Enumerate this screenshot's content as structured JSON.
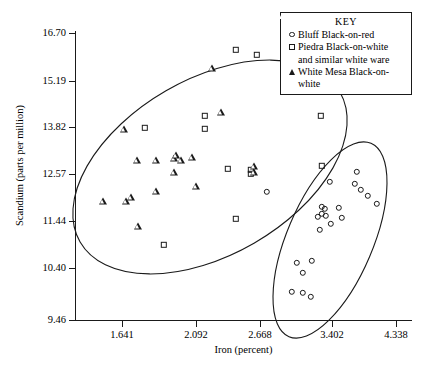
{
  "chart_data": {
    "type": "scatter",
    "title": "",
    "xlabel": "Iron (percent)",
    "ylabel": "Scandium (parts per million)",
    "grid": false,
    "legend_position": "top-right",
    "legend_title": "KEY",
    "xticks": [
      {
        "label": "1.641",
        "px": 122
      },
      {
        "label": "2.092",
        "px": 196
      },
      {
        "label": "2.668",
        "px": 260
      },
      {
        "label": "3.402",
        "px": 332
      },
      {
        "label": "4.338",
        "px": 396
      }
    ],
    "yticks": [
      {
        "label": "16.70",
        "px": 33
      },
      {
        "label": "15.19",
        "px": 81
      },
      {
        "label": "13.82",
        "px": 127
      },
      {
        "label": "12.57",
        "px": 174
      },
      {
        "label": "11.44",
        "px": 221
      },
      {
        "label": "10.40",
        "px": 268
      },
      {
        "label": "9.46",
        "px": 320
      }
    ],
    "xlim_px": [
      75,
      412
    ],
    "ylim_px": [
      31,
      320
    ],
    "series": [
      {
        "name": "Bluff Black-on-red",
        "marker": "circle",
        "points_px": [
          [
            267,
            192
          ],
          [
            330,
            182
          ],
          [
            357,
            172
          ],
          [
            355,
            184
          ],
          [
            361,
            190
          ],
          [
            368,
            196
          ],
          [
            377,
            204
          ],
          [
            322,
            207
          ],
          [
            325,
            209
          ],
          [
            322,
            214
          ],
          [
            326,
            216
          ],
          [
            339,
            208
          ],
          [
            342,
            218
          ],
          [
            318,
            217
          ],
          [
            331,
            224
          ],
          [
            320,
            230
          ],
          [
            297,
            263
          ],
          [
            312,
            261
          ],
          [
            303,
            273
          ],
          [
            292,
            292
          ],
          [
            303,
            293
          ],
          [
            311,
            297
          ]
        ]
      },
      {
        "name": "Piedra Black-on-white and similar white ware",
        "marker": "square",
        "points_px": [
          [
            236,
            50
          ],
          [
            257,
            55
          ],
          [
            321,
            116
          ],
          [
            205,
            116
          ],
          [
            205,
            129
          ],
          [
            145,
            128
          ],
          [
            228,
            169
          ],
          [
            251,
            170
          ],
          [
            251,
            174
          ],
          [
            322,
            166
          ],
          [
            236,
            219
          ],
          [
            164,
            245
          ]
        ]
      },
      {
        "name": "White Mesa Black-on-white",
        "marker": "triangle",
        "points_px": [
          [
            212,
            68
          ],
          [
            221,
            112
          ],
          [
            124,
            129
          ],
          [
            137,
            160
          ],
          [
            156,
            160
          ],
          [
            174,
            158
          ],
          [
            176,
            155
          ],
          [
            181,
            160
          ],
          [
            192,
            157
          ],
          [
            174,
            172
          ],
          [
            196,
            186
          ],
          [
            156,
            191
          ],
          [
            103,
            201
          ],
          [
            126,
            201
          ],
          [
            131,
            197
          ],
          [
            138,
            226
          ],
          [
            254,
            166
          ],
          [
            254,
            172
          ]
        ]
      }
    ],
    "ellipses": [
      {
        "name": "left-group",
        "cx": 210,
        "cy": 167,
        "rx": 150,
        "ry": 88,
        "rotation": -30
      },
      {
        "name": "right-group",
        "cx": 330,
        "cy": 240,
        "rx": 105,
        "ry": 43,
        "rotation": -67
      }
    ]
  },
  "legend": {
    "title": "KEY",
    "entries": [
      {
        "symbol": "circle-marker-icon",
        "label": "Bluff Black-on-red",
        "cont": ""
      },
      {
        "symbol": "square-marker-icon",
        "label": "Piedra Black-on-white",
        "cont": "and similar white ware"
      },
      {
        "symbol": "triangle-marker-icon",
        "label": "White Mesa Black-on-",
        "cont": "white"
      }
    ]
  }
}
